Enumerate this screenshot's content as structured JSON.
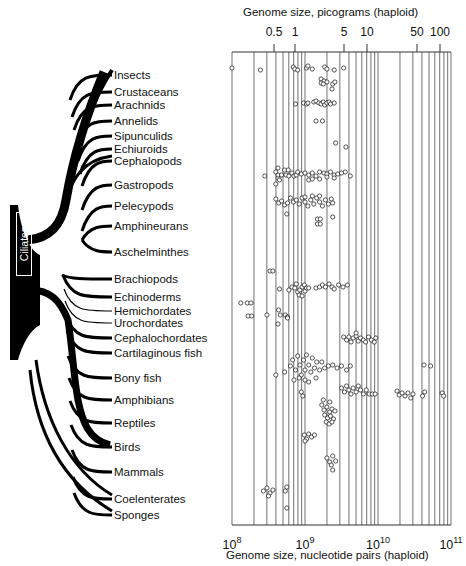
{
  "top_axis": {
    "title": "Genome size, picograms (haploid)",
    "ticks": [
      {
        "label": "0.5",
        "x": 274
      },
      {
        "label": "1",
        "x": 295
      },
      {
        "label": "5",
        "x": 344
      },
      {
        "label": "10",
        "x": 367
      },
      {
        "label": "50",
        "x": 417
      },
      {
        "label": "100",
        "x": 440
      }
    ]
  },
  "bottom_axis": {
    "title": "Genome size, nucleotide pairs (haploid)",
    "ticks": [
      {
        "base": "10",
        "exp": "8",
        "x": 232
      },
      {
        "base": "10",
        "exp": "9",
        "x": 305
      },
      {
        "base": "10",
        "exp": "10",
        "x": 378
      },
      {
        "base": "10",
        "exp": "11",
        "x": 451
      }
    ]
  },
  "tree": {
    "root_label": "Ciliates"
  },
  "taxa": [
    {
      "label": "Insects",
      "y": 69
    },
    {
      "label": "Crustaceans",
      "y": 86
    },
    {
      "label": "Arachnids",
      "y": 99
    },
    {
      "label": "Annelids",
      "y": 115
    },
    {
      "label": "Sipunculids",
      "y": 130
    },
    {
      "label": "Echiuroids",
      "y": 143
    },
    {
      "label": "Cephalopods",
      "y": 155
    },
    {
      "label": "Gastropods",
      "y": 179
    },
    {
      "label": "Pelecypods",
      "y": 200
    },
    {
      "label": "Amphineurans",
      "y": 220
    },
    {
      "label": "Aschelminthes",
      "y": 246
    },
    {
      "label": "Brachiopods",
      "y": 273
    },
    {
      "label": "Echinoderms",
      "y": 291
    },
    {
      "label": "Hemichordates",
      "y": 305
    },
    {
      "label": "Urochordates",
      "y": 317
    },
    {
      "label": "Cephalochordates",
      "y": 332
    },
    {
      "label": "Cartilaginous fish",
      "y": 347
    },
    {
      "label": "Bony fish",
      "y": 372
    },
    {
      "label": "Amphibians",
      "y": 394
    },
    {
      "label": "Reptiles",
      "y": 417
    },
    {
      "label": "Birds",
      "y": 441
    },
    {
      "label": "Mammals",
      "y": 466
    },
    {
      "label": "Coelenterates",
      "y": 493
    },
    {
      "label": "Sponges",
      "y": 509
    }
  ],
  "chart_data": {
    "type": "scatter",
    "xlabel": "Genome size, nucleotide pairs (haploid)",
    "x2label": "Genome size, picograms (haploid)",
    "xscale": "log",
    "xlim": [
      100000000,
      100000000000
    ],
    "x_ticks": [
      "10^8",
      "10^9",
      "10^10",
      "10^11"
    ],
    "x2_ticks": [
      "0.5",
      "1",
      "5",
      "10",
      "50",
      "100"
    ],
    "grid": true,
    "categories": [
      "Insects",
      "Crustaceans",
      "Arachnids",
      "Annelids",
      "Sipunculids",
      "Echiuroids",
      "Cephalopods",
      "Gastropods",
      "Pelecypods",
      "Amphineurans",
      "Aschelminthes",
      "Brachiopods",
      "Echinoderms",
      "Hemichordates",
      "Urochordates",
      "Cephalochordates",
      "Cartilaginous fish",
      "Bony fish",
      "Amphibians",
      "Reptiles",
      "Birds",
      "Mammals",
      "Coelenterates",
      "Sponges"
    ],
    "ranges_log10_bp": [
      {
        "taxon": "Insects",
        "min": 8.0,
        "max": 9.5,
        "cluster": [
          8.0,
          8.4,
          8.85,
          8.9,
          9.05,
          9.1,
          9.3,
          9.55
        ]
      },
      {
        "taxon": "Crustaceans",
        "min": 9.2,
        "max": 9.45,
        "cluster": [
          9.2,
          9.25,
          9.3,
          9.35,
          9.45
        ]
      },
      {
        "taxon": "Arachnids",
        "min": 9.4,
        "max": 9.4,
        "cluster": [
          9.4
        ]
      },
      {
        "taxon": "Annelids",
        "min": 8.85,
        "max": 9.55,
        "cluster": [
          8.85,
          9.0,
          9.05,
          9.15,
          9.25,
          9.3,
          9.35,
          9.45,
          9.55
        ]
      },
      {
        "taxon": "Sipunculids",
        "min": 9.15,
        "max": 9.25,
        "cluster": [
          9.15,
          9.25
        ]
      },
      {
        "taxon": "Echiuroids",
        "min": 9.35,
        "max": 9.35,
        "cluster": []
      },
      {
        "taxon": "Cephalopods",
        "min": 9.45,
        "max": 9.65,
        "cluster": [
          9.45,
          9.65
        ]
      },
      {
        "taxon": "Gastropods",
        "min": 8.7,
        "max": 9.65,
        "cluster": [
          8.7,
          8.8,
          8.85,
          8.9,
          8.95,
          9.0,
          9.1,
          9.15,
          9.2,
          9.3,
          9.35,
          9.4,
          9.45,
          9.5,
          9.6
        ]
      },
      {
        "taxon": "Pelecypods",
        "min": 8.7,
        "max": 9.4,
        "cluster": [
          8.7,
          8.75,
          8.8,
          8.9,
          8.95,
          9.0,
          9.05,
          9.1,
          9.15,
          9.2,
          9.25,
          9.3,
          9.35,
          9.4
        ]
      },
      {
        "taxon": "Amphineurans",
        "min": 9.15,
        "max": 9.25,
        "cluster": [
          9.15,
          9.2,
          9.25
        ]
      },
      {
        "taxon": "Brachiopods",
        "min": 8.55,
        "max": 8.6,
        "cluster": [
          8.55,
          8.6
        ]
      },
      {
        "taxon": "Echinoderms",
        "min": 8.75,
        "max": 9.65,
        "cluster": [
          8.75,
          8.85,
          8.9,
          8.95,
          9.0,
          9.05,
          9.1,
          9.2,
          9.3,
          9.35,
          9.45,
          9.5,
          9.65
        ]
      },
      {
        "taxon": "Hemichordates",
        "min": 8.2,
        "max": 8.4,
        "cluster": [
          8.2,
          8.35,
          8.4
        ]
      },
      {
        "taxon": "Urochordates",
        "min": 8.35,
        "max": 8.9,
        "cluster": [
          8.35,
          8.4,
          8.7,
          8.85,
          8.9
        ]
      },
      {
        "taxon": "Cephalochordates",
        "min": 8.85,
        "max": 8.85,
        "cluster": [
          8.85
        ]
      },
      {
        "taxon": "Cartilaginous fish",
        "min": 9.45,
        "max": 9.95,
        "cluster": [
          9.45,
          9.5,
          9.55,
          9.6,
          9.65,
          9.7,
          9.75,
          9.8,
          9.85,
          9.9,
          9.95
        ]
      },
      {
        "taxon": "Bony fish",
        "min": 8.55,
        "max": 9.65,
        "cluster": [
          8.55,
          8.65,
          8.75,
          8.85,
          8.9,
          8.95,
          9.0,
          9.05,
          9.1,
          9.15,
          9.2,
          9.25,
          9.3,
          9.4,
          9.5,
          9.6,
          9.65,
          10.6,
          10.7
        ]
      },
      {
        "taxon": "Amphibians",
        "min": 8.9,
        "max": 10.9,
        "cluster": [
          8.9,
          8.95,
          9.0,
          9.45,
          9.5,
          9.55,
          9.6,
          9.65,
          9.7,
          9.75,
          9.8,
          9.85,
          9.9,
          9.95,
          10.25,
          10.3,
          10.35,
          10.4,
          10.45,
          10.6,
          10.7,
          10.9
        ]
      },
      {
        "taxon": "Reptiles",
        "min": 9.2,
        "max": 9.45,
        "cluster": [
          9.2,
          9.25,
          9.3,
          9.35,
          9.4,
          9.45
        ]
      },
      {
        "taxon": "Birds",
        "min": 8.95,
        "max": 9.15,
        "cluster": [
          8.95,
          9.0,
          9.05,
          9.1,
          9.15
        ]
      },
      {
        "taxon": "Mammals",
        "min": 9.3,
        "max": 9.5,
        "cluster": [
          9.3,
          9.35,
          9.4,
          9.45,
          9.5
        ]
      },
      {
        "taxon": "Coelenterates",
        "min": 8.45,
        "max": 8.85,
        "cluster": [
          8.45,
          8.5,
          8.55,
          8.6,
          8.8,
          8.85
        ]
      },
      {
        "taxon": "Sponges",
        "min": 8.8,
        "max": 8.8,
        "cluster": [
          8.8
        ]
      }
    ]
  },
  "plot_points": [
    [
      8.0,
      68
    ],
    [
      8.39,
      70
    ],
    [
      8.84,
      67
    ],
    [
      8.86,
      69
    ],
    [
      8.9,
      70
    ],
    [
      9.02,
      68
    ],
    [
      9.04,
      66
    ],
    [
      9.1,
      69
    ],
    [
      9.27,
      67
    ],
    [
      9.3,
      69
    ],
    [
      9.4,
      70
    ],
    [
      9.53,
      68
    ],
    [
      9.22,
      79
    ],
    [
      9.26,
      81
    ],
    [
      9.22,
      83
    ],
    [
      9.25,
      84
    ],
    [
      9.3,
      82
    ],
    [
      9.38,
      84
    ],
    [
      9.41,
      82
    ],
    [
      9.37,
      89
    ],
    [
      8.87,
      104
    ],
    [
      8.98,
      103
    ],
    [
      9.02,
      104
    ],
    [
      9.04,
      103
    ],
    [
      9.12,
      102
    ],
    [
      9.15,
      101
    ],
    [
      9.19,
      103
    ],
    [
      9.22,
      104
    ],
    [
      9.25,
      102
    ],
    [
      9.27,
      105
    ],
    [
      9.3,
      103
    ],
    [
      9.33,
      102
    ],
    [
      9.35,
      104
    ],
    [
      9.4,
      103
    ],
    [
      9.15,
      121
    ],
    [
      9.24,
      121
    ],
    [
      9.42,
      143
    ],
    [
      9.56,
      147
    ],
    [
      8.6,
      172
    ],
    [
      8.63,
      178
    ],
    [
      8.63,
      168
    ],
    [
      8.65,
      180
    ],
    [
      8.63,
      175
    ],
    [
      8.68,
      175
    ],
    [
      8.72,
      170
    ],
    [
      8.74,
      175
    ],
    [
      8.77,
      170
    ],
    [
      8.78,
      176
    ],
    [
      8.82,
      173
    ],
    [
      8.85,
      176
    ],
    [
      8.88,
      175
    ],
    [
      8.9,
      172
    ],
    [
      8.95,
      174
    ],
    [
      9.0,
      173
    ],
    [
      9.05,
      175
    ],
    [
      9.1,
      173
    ],
    [
      9.15,
      176
    ],
    [
      9.2,
      172
    ],
    [
      9.26,
      173
    ],
    [
      9.3,
      174
    ],
    [
      9.35,
      172
    ],
    [
      9.4,
      175
    ],
    [
      9.45,
      174
    ],
    [
      9.5,
      173
    ],
    [
      9.55,
      172
    ],
    [
      9.62,
      176
    ],
    [
      8.45,
      176
    ],
    [
      8.6,
      184
    ],
    [
      9.05,
      180
    ],
    [
      9.1,
      179
    ],
    [
      9.2,
      179
    ],
    [
      9.3,
      177
    ],
    [
      9.4,
      178
    ],
    [
      8.6,
      199
    ],
    [
      8.64,
      203
    ],
    [
      8.68,
      201
    ],
    [
      8.72,
      205
    ],
    [
      8.76,
      203
    ],
    [
      8.8,
      198
    ],
    [
      8.84,
      202
    ],
    [
      8.88,
      200
    ],
    [
      8.92,
      204
    ],
    [
      8.96,
      198
    ],
    [
      9.0,
      202
    ],
    [
      9.04,
      206
    ],
    [
      9.08,
      200
    ],
    [
      9.12,
      204
    ],
    [
      9.16,
      198
    ],
    [
      9.2,
      202
    ],
    [
      9.24,
      206
    ],
    [
      9.28,
      200
    ],
    [
      9.32,
      204
    ],
    [
      9.36,
      199
    ],
    [
      9.38,
      203
    ],
    [
      9.0,
      197
    ],
    [
      9.1,
      196
    ],
    [
      9.2,
      196
    ],
    [
      8.75,
      214
    ],
    [
      9.17,
      219
    ],
    [
      9.21,
      219
    ],
    [
      9.17,
      224
    ],
    [
      9.21,
      224
    ],
    [
      9.38,
      217
    ],
    [
      8.52,
      271
    ],
    [
      8.56,
      271
    ],
    [
      8.65,
      289
    ],
    [
      8.78,
      290
    ],
    [
      8.82,
      287
    ],
    [
      8.86,
      288
    ],
    [
      8.88,
      284
    ],
    [
      8.9,
      292
    ],
    [
      8.93,
      290
    ],
    [
      8.96,
      287
    ],
    [
      8.99,
      285
    ],
    [
      9.0,
      291
    ],
    [
      9.02,
      288
    ],
    [
      8.92,
      295
    ],
    [
      8.96,
      296
    ],
    [
      9.05,
      288
    ],
    [
      9.15,
      288
    ],
    [
      9.2,
      287
    ],
    [
      9.24,
      285
    ],
    [
      9.28,
      287
    ],
    [
      9.33,
      284
    ],
    [
      9.37,
      287
    ],
    [
      9.4,
      289
    ],
    [
      9.46,
      285
    ],
    [
      9.52,
      287
    ],
    [
      9.58,
      285
    ],
    [
      8.12,
      303
    ],
    [
      8.21,
      303
    ],
    [
      8.26,
      303
    ],
    [
      8.22,
      316
    ],
    [
      8.27,
      316
    ],
    [
      8.48,
      315
    ],
    [
      8.66,
      315
    ],
    [
      8.73,
      315
    ],
    [
      8.76,
      317
    ],
    [
      8.76,
      318
    ],
    [
      8.64,
      310
    ],
    [
      8.63,
      324
    ],
    [
      9.53,
      337
    ],
    [
      9.57,
      340
    ],
    [
      9.6,
      337
    ],
    [
      9.63,
      342
    ],
    [
      9.66,
      338
    ],
    [
      9.7,
      336
    ],
    [
      9.73,
      341
    ],
    [
      9.76,
      338
    ],
    [
      9.8,
      340
    ],
    [
      9.83,
      342
    ],
    [
      9.87,
      337
    ],
    [
      9.91,
      340
    ],
    [
      9.95,
      342
    ],
    [
      9.97,
      338
    ],
    [
      9.7,
      333
    ],
    [
      8.6,
      375
    ],
    [
      8.72,
      372
    ],
    [
      8.8,
      366
    ],
    [
      8.83,
      360
    ],
    [
      8.87,
      370
    ],
    [
      8.9,
      356
    ],
    [
      8.93,
      365
    ],
    [
      8.95,
      375
    ],
    [
      8.98,
      360
    ],
    [
      9.0,
      370
    ],
    [
      9.02,
      355
    ],
    [
      9.05,
      365
    ],
    [
      9.08,
      372
    ],
    [
      9.1,
      358
    ],
    [
      9.13,
      368
    ],
    [
      9.16,
      362
    ],
    [
      9.2,
      370
    ],
    [
      9.23,
      362
    ],
    [
      9.27,
      368
    ],
    [
      9.32,
      366
    ],
    [
      9.38,
      365
    ],
    [
      9.44,
      368
    ],
    [
      9.5,
      366
    ],
    [
      9.57,
      370
    ],
    [
      9.62,
      366
    ],
    [
      8.85,
      380
    ],
    [
      8.92,
      378
    ],
    [
      9.0,
      380
    ],
    [
      9.05,
      382
    ],
    [
      9.15,
      378
    ],
    [
      10.63,
      365
    ],
    [
      10.72,
      366
    ],
    [
      8.95,
      392
    ],
    [
      8.97,
      396
    ],
    [
      9.5,
      388
    ],
    [
      9.54,
      392
    ],
    [
      9.57,
      386
    ],
    [
      9.6,
      390
    ],
    [
      9.63,
      394
    ],
    [
      9.66,
      388
    ],
    [
      9.7,
      392
    ],
    [
      9.73,
      386
    ],
    [
      9.76,
      390
    ],
    [
      9.8,
      394
    ],
    [
      9.84,
      390
    ],
    [
      9.88,
      394
    ],
    [
      9.92,
      394
    ],
    [
      9.96,
      394
    ],
    [
      10.26,
      391
    ],
    [
      10.29,
      395
    ],
    [
      10.33,
      393
    ],
    [
      10.37,
      396
    ],
    [
      10.41,
      393
    ],
    [
      10.45,
      398
    ],
    [
      10.48,
      394
    ],
    [
      10.61,
      396
    ],
    [
      10.64,
      392
    ],
    [
      10.88,
      393
    ],
    [
      10.9,
      396
    ],
    [
      9.23,
      405
    ],
    [
      9.26,
      410
    ],
    [
      9.3,
      407
    ],
    [
      9.34,
      412
    ],
    [
      9.37,
      409
    ],
    [
      9.41,
      411
    ],
    [
      9.27,
      415
    ],
    [
      9.31,
      418
    ],
    [
      9.35,
      416
    ],
    [
      9.39,
      419
    ],
    [
      9.29,
      422
    ],
    [
      9.33,
      424
    ],
    [
      9.37,
      422
    ],
    [
      9.25,
      400
    ],
    [
      9.34,
      402
    ],
    [
      8.99,
      435
    ],
    [
      9.02,
      439
    ],
    [
      9.05,
      434
    ],
    [
      9.09,
      437
    ],
    [
      9.13,
      435
    ],
    [
      9.0,
      441
    ],
    [
      9.3,
      458
    ],
    [
      9.34,
      462
    ],
    [
      9.38,
      456
    ],
    [
      9.42,
      461
    ],
    [
      9.36,
      465
    ],
    [
      9.38,
      470
    ],
    [
      8.43,
      491
    ],
    [
      8.48,
      488
    ],
    [
      8.52,
      493
    ],
    [
      8.56,
      490
    ],
    [
      8.5,
      496
    ],
    [
      8.73,
      491
    ],
    [
      8.75,
      487
    ],
    [
      8.75,
      508
    ]
  ]
}
